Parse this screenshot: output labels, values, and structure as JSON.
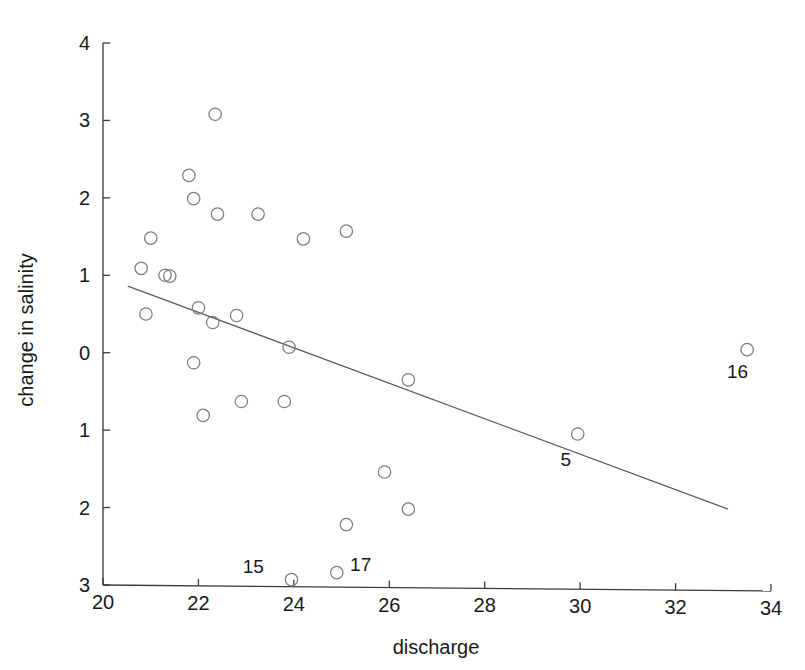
{
  "chart_data": {
    "type": "scatter",
    "title": "",
    "xlabel": "discharge",
    "ylabel": "change in salinity",
    "xlim": [
      20,
      34
    ],
    "ylim": [
      -3,
      4
    ],
    "grid": false,
    "legend": false,
    "xticks": [
      20,
      22,
      24,
      26,
      28,
      30,
      32,
      34
    ],
    "xtick_labels": [
      "20",
      "22",
      "24",
      "26",
      "28",
      "30",
      "32",
      "34"
    ],
    "yticks": [
      4,
      3,
      2,
      1,
      0,
      -1,
      -2,
      -3
    ],
    "ytick_labels": [
      "4",
      "3",
      "2",
      "1",
      "0",
      "1",
      "2",
      "3"
    ],
    "marker": "open-circle",
    "points": [
      {
        "x": 20.8,
        "y": 1.09
      },
      {
        "x": 20.9,
        "y": 0.5
      },
      {
        "x": 21.0,
        "y": 1.48
      },
      {
        "x": 21.3,
        "y": 1.0
      },
      {
        "x": 21.4,
        "y": 0.99
      },
      {
        "x": 21.8,
        "y": 2.29
      },
      {
        "x": 21.9,
        "y": 1.99
      },
      {
        "x": 21.9,
        "y": -0.13
      },
      {
        "x": 22.0,
        "y": 0.58
      },
      {
        "x": 22.1,
        "y": -0.81
      },
      {
        "x": 22.3,
        "y": 0.39
      },
      {
        "x": 22.35,
        "y": 3.08
      },
      {
        "x": 22.4,
        "y": 1.79
      },
      {
        "x": 22.8,
        "y": 0.48
      },
      {
        "x": 22.9,
        "y": -0.63
      },
      {
        "x": 23.25,
        "y": 1.79
      },
      {
        "x": 23.8,
        "y": -0.63
      },
      {
        "x": 23.9,
        "y": 0.07
      },
      {
        "x": 23.95,
        "y": -2.93
      },
      {
        "x": 24.2,
        "y": 1.47
      },
      {
        "x": 24.9,
        "y": -2.84
      },
      {
        "x": 25.1,
        "y": 1.57
      },
      {
        "x": 25.1,
        "y": -2.22
      },
      {
        "x": 25.9,
        "y": -1.54
      },
      {
        "x": 26.4,
        "y": -0.35
      },
      {
        "x": 26.4,
        "y": -2.02
      },
      {
        "x": 29.95,
        "y": -1.05
      },
      {
        "x": 33.5,
        "y": 0.04
      }
    ],
    "point_labels": [
      {
        "text": "5",
        "x": 29.7,
        "y": -1.46
      },
      {
        "text": "15",
        "x": 23.15,
        "y": -2.85
      },
      {
        "text": "16",
        "x": 33.3,
        "y": -0.33
      },
      {
        "text": "17",
        "x": 25.4,
        "y": -2.82
      }
    ],
    "fit_line": {
      "x1": 20.52,
      "y1": 0.86,
      "x2": 33.1,
      "y2": -2.02
    },
    "colors": {
      "marker_stroke": "#7d7d84",
      "line": "#5c5c62",
      "axis": "#3a3a3a",
      "text": "#1a1a1a",
      "background": "#ffffff"
    }
  }
}
